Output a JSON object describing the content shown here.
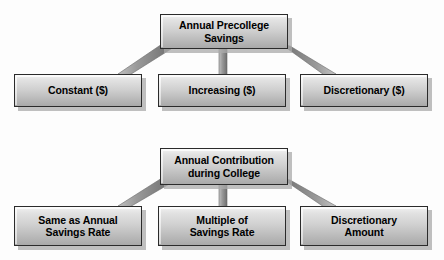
{
  "diagram": {
    "background_color": "#fdfdfd",
    "box_fill_top_color": "#f2f2f2",
    "box_fill_bottom_color": "#a9a9a9",
    "box_border_color": "#2b2b2b",
    "connector_color": "#8c8c8c",
    "shadow_color": "#aaaaaa",
    "text_color": "#000000",
    "groups": [
      {
        "id": "precollege-savings",
        "parent": {
          "label": "Annual Precollege\nSavings"
        },
        "children": [
          {
            "label": "Constant ($)"
          },
          {
            "label": "Increasing ($)"
          },
          {
            "label": "Discretionary ($)"
          }
        ]
      },
      {
        "id": "contribution-during-college",
        "parent": {
          "label": "Annual Contribution\nduring College"
        },
        "children": [
          {
            "label": "Same as Annual\nSavings Rate"
          },
          {
            "label": "Multiple of\nSavings Rate"
          },
          {
            "label": "Discretionary\nAmount"
          }
        ]
      }
    ]
  }
}
